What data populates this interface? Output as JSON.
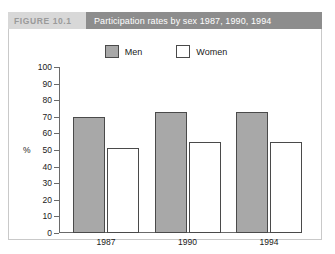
{
  "figure": {
    "number_label": "FIGURE 10.1",
    "title": "Participation rates by sex 1987, 1990, 1994"
  },
  "chart_data": {
    "type": "bar",
    "title": "Participation rates by sex 1987, 1990, 1994",
    "categories": [
      "1987",
      "1990",
      "1994"
    ],
    "series": [
      {
        "name": "Men",
        "values": [
          70,
          73,
          73
        ],
        "color": "#a8a8a8"
      },
      {
        "name": "Women",
        "values": [
          51,
          55,
          55
        ],
        "color": "#ffffff"
      }
    ],
    "xlabel": "",
    "ylabel": "%",
    "ylim": [
      0,
      100
    ],
    "yticks": [
      0,
      10,
      20,
      30,
      40,
      50,
      60,
      70,
      80,
      90,
      100
    ],
    "ytick_labels": [
      "0",
      "10",
      "20",
      "30",
      "40",
      "50",
      "60",
      "70",
      "80",
      "90",
      "100"
    ],
    "grid": false,
    "legend_position": "top-center"
  },
  "colors": {
    "men_bar": "#a8a8a8",
    "women_bar": "#ffffff",
    "bar_outline": "#4a4a4a",
    "axis": "#6a6a6a",
    "title_band": "#8d8d8d",
    "label_band": "#d8d8d8"
  }
}
